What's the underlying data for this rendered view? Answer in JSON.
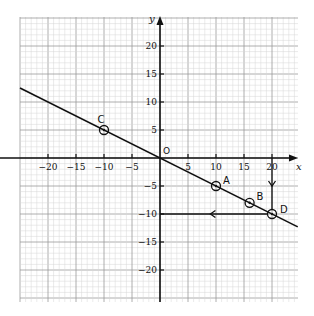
{
  "chart_data": {
    "type": "line",
    "title": "",
    "xlabel": "x",
    "ylabel": "y",
    "origin_label": "O",
    "xlim": [
      -25,
      24.6
    ],
    "ylim": [
      -25.6,
      25.2
    ],
    "grid": true,
    "x_ticks": [
      -20,
      -15,
      -10,
      -5,
      5,
      10,
      15,
      20
    ],
    "x_tick_labels": [
      "−20",
      "−15",
      "−10",
      "−5",
      "5",
      "10",
      "15",
      "20"
    ],
    "y_ticks": [
      20,
      15,
      10,
      5,
      -5,
      -10,
      -15,
      -20
    ],
    "y_tick_labels": [
      "20",
      "15",
      "10",
      "5",
      "−5",
      "−10",
      "−15",
      "−20"
    ],
    "series": [
      {
        "name": "y = -x/2",
        "x": [
          -25,
          24.6
        ],
        "y": [
          12.5,
          -12.3
        ]
      }
    ],
    "points": [
      {
        "label": "C",
        "x": -10,
        "y": 5
      },
      {
        "label": "A",
        "x": 10,
        "y": -5
      },
      {
        "label": "B",
        "x": 16,
        "y": -8
      },
      {
        "label": "D",
        "x": 20,
        "y": -10
      }
    ],
    "annotations": [
      {
        "type": "arrow",
        "from": [
          20,
          0
        ],
        "to": [
          20,
          -10
        ],
        "description": "vertical arrow from x=20 down to D"
      },
      {
        "type": "arrow",
        "from": [
          20,
          -10
        ],
        "to": [
          0,
          -10
        ],
        "description": "horizontal arrow from D left to y-axis at y=-10"
      }
    ]
  }
}
